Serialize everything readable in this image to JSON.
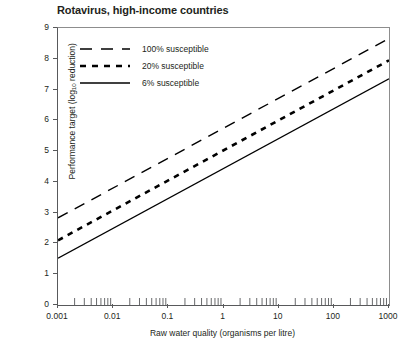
{
  "chart_data": {
    "type": "line",
    "title": "Rotavirus, high-income countries",
    "xlabel": "Raw water quality (organisms per litre)",
    "ylabel": "Performance target (log10 reduction)",
    "ylabel_prefix": "Performance target (log",
    "ylabel_sub": "10",
    "ylabel_suffix": " reduction)",
    "xscale": "log",
    "xlim": [
      0.001,
      1000
    ],
    "ylim": [
      0,
      9
    ],
    "grid": false,
    "legend_position": "top-left inside plot",
    "xticks": [
      0.001,
      0.01,
      0.1,
      1,
      10,
      100,
      1000
    ],
    "xtick_labels": [
      "0.001",
      "0.01",
      "0.1",
      "1",
      "10",
      "100",
      "1000"
    ],
    "yticks": [
      0,
      1,
      2,
      3,
      4,
      5,
      6,
      7,
      8,
      9
    ],
    "ytick_labels": [
      "0",
      "1",
      "2",
      "3",
      "4",
      "5",
      "6",
      "7",
      "8",
      "9"
    ],
    "series": [
      {
        "name": "100% susceptible",
        "style": "long-dash",
        "x": [
          0.001,
          1000
        ],
        "y": [
          2.83,
          8.66
        ]
      },
      {
        "name": "20% susceptible",
        "style": "short-dash-bold",
        "x": [
          0.001,
          1000
        ],
        "y": [
          2.1,
          7.95
        ]
      },
      {
        "name": "6% susceptible",
        "style": "solid",
        "x": [
          0.001,
          1000
        ],
        "y": [
          1.52,
          7.35
        ]
      }
    ]
  },
  "legend": {
    "items": [
      {
        "label": "100% susceptible",
        "style": "long-dash"
      },
      {
        "label": "20% susceptible",
        "style": "short-dash-bold"
      },
      {
        "label": "6% susceptible",
        "style": "solid"
      }
    ]
  },
  "colors": {
    "line": "#000000",
    "axis": "#58595b",
    "frame": "#8d8d8d",
    "text": "#231f20",
    "background": "#ffffff"
  }
}
